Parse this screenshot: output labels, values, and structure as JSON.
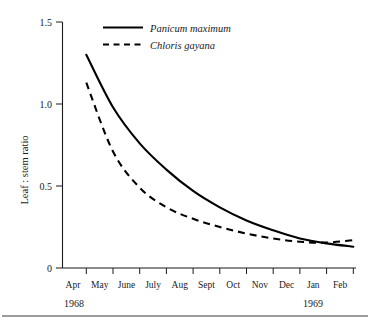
{
  "chart_data": {
    "type": "line",
    "title": "",
    "subtitle": "",
    "xlabel": "",
    "ylabel": "Leaf : stem ratio",
    "categories": [
      "Apr",
      "May",
      "June",
      "July",
      "Aug",
      "Sept",
      "Oct",
      "Nov",
      "Dec",
      "Jan",
      "Feb"
    ],
    "x": [
      0,
      1,
      2,
      3,
      4,
      5,
      6,
      7,
      8,
      9,
      10
    ],
    "xlim": [
      0,
      10
    ],
    "ylim": [
      0,
      1.5
    ],
    "yticks": [
      0,
      0.5,
      1.0,
      1.5
    ],
    "ytick_labels": [
      "0",
      "0.5",
      "1.0",
      "1.5"
    ],
    "grid": false,
    "legend_position": "top-left-inside",
    "series": [
      {
        "name": "Panicum maximum",
        "style": "solid",
        "color": "#000000",
        "values": [
          1.3,
          0.98,
          0.76,
          0.6,
          0.47,
          0.37,
          0.29,
          0.23,
          0.18,
          0.15,
          0.13
        ]
      },
      {
        "name": "Chloris gayana",
        "style": "dashed",
        "color": "#000000",
        "values": [
          1.13,
          0.71,
          0.49,
          0.37,
          0.3,
          0.25,
          0.21,
          0.18,
          0.16,
          0.155,
          0.17
        ]
      }
    ],
    "annotations": [
      {
        "text": "1968",
        "under_category": "Apr"
      },
      {
        "text": "1969",
        "under_category": "Jan"
      }
    ]
  },
  "axis": {
    "y_title": "Leaf : stem ratio",
    "y_tick_labels": [
      "1.5",
      "1.0",
      "0.5",
      "0"
    ],
    "x_tick_labels": [
      "Apr",
      "May",
      "June",
      "July",
      "Aug",
      "Sept",
      "Oct",
      "Nov",
      "Dec",
      "Jan",
      "Feb"
    ]
  },
  "years": {
    "start": "1968",
    "end": "1969"
  },
  "legend": {
    "entries": [
      {
        "label": "Panicum maximum",
        "style": "solid"
      },
      {
        "label": "Chloris gayana",
        "style": "dashed"
      }
    ]
  }
}
